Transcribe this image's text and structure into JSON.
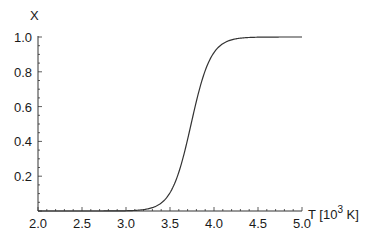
{
  "chart_data": {
    "type": "line",
    "title": "",
    "xlabel": "T [10^3 K]",
    "xlabel_parts": {
      "base": "T [10",
      "sup": "3",
      "rest": " K]"
    },
    "ylabel": "X",
    "xlim": [
      2.0,
      5.0
    ],
    "ylim": [
      0.0,
      1.0
    ],
    "grid": false,
    "legend": null,
    "x_ticks": [
      "2.0",
      "2.5",
      "3.0",
      "3.5",
      "4.0",
      "4.5",
      "5.0"
    ],
    "y_ticks": [
      "0.2",
      "0.4",
      "0.6",
      "0.8",
      "1.0"
    ],
    "series": [
      {
        "name": "X(T)",
        "description": "sigmoidal rise from 0 to 1, midpoint near T = 3.74",
        "x": [
          2.0,
          2.5,
          3.0,
          3.1,
          3.2,
          3.3,
          3.4,
          3.5,
          3.6,
          3.7,
          3.75,
          3.8,
          3.9,
          4.0,
          4.1,
          4.2,
          4.3,
          4.5,
          5.0
        ],
        "y": [
          0.0,
          0.0,
          0.001,
          0.004,
          0.008,
          0.02,
          0.05,
          0.11,
          0.22,
          0.41,
          0.52,
          0.63,
          0.8,
          0.92,
          0.96,
          0.985,
          0.995,
          1.0,
          1.0
        ]
      }
    ]
  }
}
